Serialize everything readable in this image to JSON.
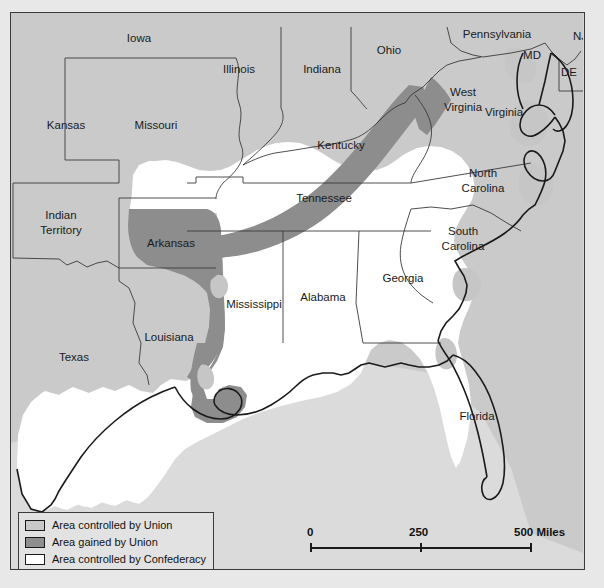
{
  "map": {
    "title": "Civil War Territorial Control Map",
    "colors": {
      "union": "#c9c9c9",
      "gained": "#8e8e8e",
      "confederacy": "#ffffff",
      "ocean": "#dcdcdc",
      "border": "#1a1a1a",
      "frame": "#3a3a3a",
      "background": "#e2e2e2"
    },
    "labels": [
      {
        "name": "iowa",
        "text": "Iowa",
        "x": 128,
        "y": 26,
        "size": 11.5
      },
      {
        "name": "illinois",
        "text": "Illinois",
        "x": 228,
        "y": 57,
        "size": 11.5
      },
      {
        "name": "indiana",
        "text": "Indiana",
        "x": 311,
        "y": 57,
        "size": 11.5
      },
      {
        "name": "ohio",
        "text": "Ohio",
        "x": 378,
        "y": 38,
        "size": 11.5
      },
      {
        "name": "pennsylvania",
        "text": "Pennsylvania",
        "x": 486,
        "y": 22,
        "size": 11.5
      },
      {
        "name": "nj",
        "text": "NJ",
        "x": 569,
        "y": 24,
        "size": 11.5
      },
      {
        "name": "md",
        "text": "MD",
        "x": 521,
        "y": 43,
        "size": 11.5
      },
      {
        "name": "de",
        "text": "DE",
        "x": 558,
        "y": 60,
        "size": 11.5
      },
      {
        "name": "kansas",
        "text": "Kansas",
        "x": 55,
        "y": 113,
        "size": 11.5
      },
      {
        "name": "missouri",
        "text": "Missouri",
        "x": 145,
        "y": 113,
        "size": 11.5
      },
      {
        "name": "kentucky",
        "text": "Kentucky",
        "x": 330,
        "y": 133,
        "size": 11.5
      },
      {
        "name": "west-virginia-1",
        "text": "West",
        "x": 452,
        "y": 80,
        "size": 11.5
      },
      {
        "name": "west-virginia-2",
        "text": "Virginia",
        "x": 452,
        "y": 95,
        "size": 11.5
      },
      {
        "name": "virginia",
        "text": "Virginia",
        "x": 493,
        "y": 100,
        "size": 11.5
      },
      {
        "name": "tennessee",
        "text": "Tennessee",
        "x": 313,
        "y": 186,
        "size": 11.5
      },
      {
        "name": "north-carolina-1",
        "text": "North",
        "x": 472,
        "y": 161,
        "size": 11.5
      },
      {
        "name": "north-carolina-2",
        "text": "Carolina",
        "x": 472,
        "y": 176,
        "size": 11.5
      },
      {
        "name": "indian-terr-1",
        "text": "Indian",
        "x": 50,
        "y": 203,
        "size": 11.5
      },
      {
        "name": "indian-terr-2",
        "text": "Territory",
        "x": 50,
        "y": 218,
        "size": 11.5
      },
      {
        "name": "arkansas",
        "text": "Arkansas",
        "x": 160,
        "y": 231,
        "size": 11.5
      },
      {
        "name": "south-carolina-1",
        "text": "South",
        "x": 452,
        "y": 219,
        "size": 11.5
      },
      {
        "name": "south-carolina-2",
        "text": "Carolina",
        "x": 452,
        "y": 234,
        "size": 11.5
      },
      {
        "name": "georgia",
        "text": "Georgia",
        "x": 392,
        "y": 266,
        "size": 11.5
      },
      {
        "name": "mississippi",
        "text": "Mississippi",
        "x": 243,
        "y": 292,
        "size": 11.5
      },
      {
        "name": "alabama",
        "text": "Alabama",
        "x": 312,
        "y": 285,
        "size": 11.5
      },
      {
        "name": "louisiana",
        "text": "Louisiana",
        "x": 158,
        "y": 325,
        "size": 11.5
      },
      {
        "name": "texas",
        "text": "Texas",
        "x": 63,
        "y": 345,
        "size": 11.5
      },
      {
        "name": "florida",
        "text": "Florida",
        "x": 466,
        "y": 404,
        "size": 11.5
      }
    ]
  },
  "legend": {
    "items": [
      {
        "name": "legend-union",
        "label": "Area controlled by Union",
        "swatch": "#c9c9c9"
      },
      {
        "name": "legend-gained",
        "label": "Area gained by Union",
        "swatch": "#8e8e8e"
      },
      {
        "name": "legend-confederacy",
        "label": "Area controlled by Confederacy",
        "swatch": "#ffffff"
      }
    ]
  },
  "scale": {
    "start": "0",
    "mid": "250",
    "end": "500 Miles"
  }
}
